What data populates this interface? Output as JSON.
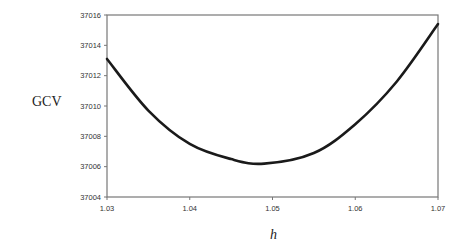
{
  "chart_data": {
    "type": "line",
    "title": "",
    "xlabel": "h",
    "ylabel": "GCV",
    "xlim": [
      1.03,
      1.07
    ],
    "ylim": [
      37004,
      37016
    ],
    "x_ticks": [
      "1.03",
      "1.04",
      "1.05",
      "1.06",
      "1.07"
    ],
    "y_ticks": [
      "37004",
      "37006",
      "37008",
      "37010",
      "37012",
      "37014",
      "37016"
    ],
    "grid": false,
    "legend": null,
    "series": [
      {
        "name": "GCV",
        "x": [
          1.03,
          1.035,
          1.04,
          1.045,
          1.049,
          1.055,
          1.06,
          1.065,
          1.07
        ],
        "y": [
          37013.1,
          37009.7,
          37007.5,
          37006.5,
          37006.2,
          37006.9,
          37008.8,
          37011.6,
          37015.4
        ]
      }
    ],
    "colors": {
      "line": "#1a1a1a",
      "axis": "#777777",
      "background": "#ffffff"
    }
  },
  "labels": {
    "ylabel": "GCV",
    "xlabel": "h"
  }
}
